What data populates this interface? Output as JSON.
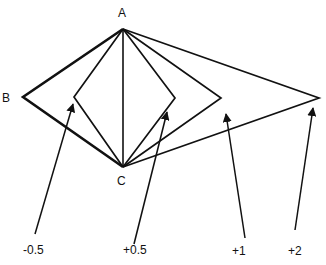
{
  "points": {
    "A": {
      "label": "A",
      "x": 123,
      "y": 29
    },
    "B": {
      "label": "B",
      "x": 23,
      "y": 97
    },
    "C": {
      "label": "C",
      "x": 123,
      "y": 167
    }
  },
  "variants": [
    {
      "label": "-0.5",
      "vertex": [
        74,
        97
      ],
      "arrow_from": [
        35,
        234
      ],
      "arrow_to": [
        73,
        104
      ]
    },
    {
      "label": "+0.5",
      "vertex": [
        175,
        98
      ],
      "arrow_from": [
        134,
        244
      ],
      "arrow_to": [
        167,
        112
      ]
    },
    {
      "label": "+1",
      "vertex": [
        221,
        98
      ],
      "arrow_from": [
        245,
        238
      ],
      "arrow_to": [
        226,
        114
      ]
    },
    {
      "label": "+2",
      "vertex": [
        319,
        98
      ],
      "arrow_from": [
        295,
        230
      ],
      "arrow_to": [
        313,
        108
      ]
    }
  ],
  "labels": {
    "A": "A",
    "B": "B",
    "C": "C",
    "m05": "-0.5",
    "p05": "+0.5",
    "p1": "+1",
    "p2": "+2"
  }
}
